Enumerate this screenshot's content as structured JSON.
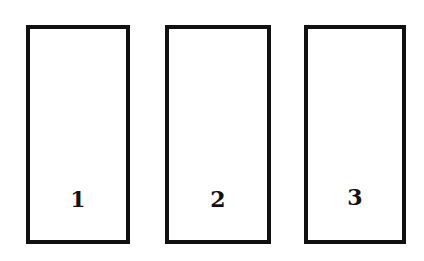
{
  "diagram": {
    "type": "numbered-boxes",
    "border_color": "#111111",
    "background_color": "#ffffff",
    "boxes": [
      {
        "label": "1",
        "left": 26,
        "top": 25,
        "width": 104,
        "height": 219
      },
      {
        "label": "2",
        "left": 165,
        "top": 25,
        "width": 106,
        "height": 219
      },
      {
        "label": "3",
        "left": 304,
        "top": 25,
        "width": 102,
        "height": 219
      }
    ]
  }
}
